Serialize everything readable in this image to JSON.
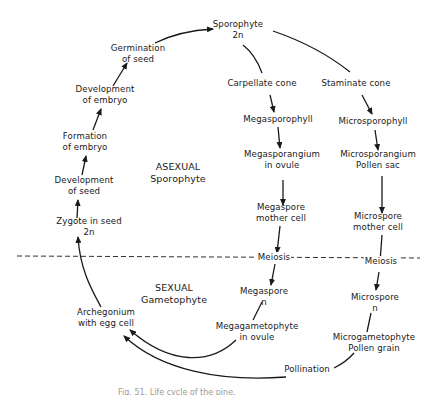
{
  "diagram": {
    "colors": {
      "ink": "#1a1a1a",
      "background": "#ffffff",
      "caption": "#9a9a9a"
    },
    "regions": {
      "asexual": {
        "line1": "ASEXUAL",
        "line2": "Sporophyte"
      },
      "sexual": {
        "line1": "SEXUAL",
        "line2": "Gametophyte"
      }
    },
    "nodes": {
      "sporophyte": {
        "line1": "Sporophyte",
        "line2": "2n"
      },
      "germination": {
        "line1": "Germination",
        "line2": "of seed"
      },
      "dev_embryo": {
        "line1": "Development",
        "line2": "of embryo"
      },
      "form_embryo": {
        "line1": "Formation",
        "line2": "of embryo"
      },
      "dev_seed": {
        "line1": "Development",
        "line2": "of seed"
      },
      "zygote": {
        "line1": "Zygote in seed",
        "line2": "2n"
      },
      "carpellate": {
        "line1": "Carpellate cone"
      },
      "staminate": {
        "line1": "Staminate cone"
      },
      "megasporophyll": {
        "line1": "Megasporophyll"
      },
      "microsporophyll": {
        "line1": "Microsporophyll"
      },
      "megasporangium": {
        "line1": "Megasporangium",
        "line2": "in ovule"
      },
      "microsporangium": {
        "line1": "Microsporangium",
        "line2": "Pollen sac"
      },
      "megaspore_mother": {
        "line1": "Megaspore",
        "line2": "mother cell"
      },
      "microspore_mother": {
        "line1": "Microspore",
        "line2": "mother cell"
      },
      "meiosis_left": {
        "line1": "Meiosis"
      },
      "meiosis_right": {
        "line1": "Meiosis"
      },
      "megaspore": {
        "line1": "Megaspore",
        "line2": "n"
      },
      "microspore": {
        "line1": "Microspore",
        "line2": "n"
      },
      "megagametophyte": {
        "line1": "Megagametophyte",
        "line2": "in ovule"
      },
      "microgametophyte": {
        "line1": "Microgametophyte",
        "line2": "Pollen grain"
      },
      "archegonium": {
        "line1": "Archegonium",
        "line2": "with egg cell"
      },
      "pollination": {
        "line1": "Pollination"
      }
    },
    "caption": "Fig. 51. Life cycle of the pine."
  }
}
